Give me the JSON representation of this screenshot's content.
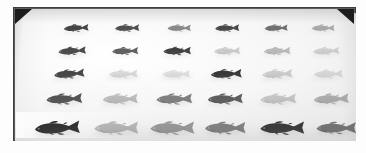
{
  "image": {
    "title": "Fish specimen photograph",
    "description": "Grayscale photograph of thirty fish specimens laid out in a five-row by six-column grid on a pale tray",
    "subject": "fish",
    "specimen_count": 30,
    "rows": 5,
    "columns": 6,
    "colors": {
      "board_frame": "#5d5d5d",
      "tray_surface": "#f2f2f2",
      "corner_mark": "#1c1c1c",
      "darkest_specimen": "#2b2b2b",
      "lightest_specimen": "#c9c9c9",
      "background": "#ffffff"
    },
    "geometry": {
      "board_left": 13,
      "board_top": 7,
      "board_width": 343,
      "board_height": 134,
      "top_corners_cut": true,
      "bottom_corners_square": true
    }
  },
  "specimens": [
    {
      "row": 1,
      "row_label": "row-1",
      "center_y": 20,
      "length": 34,
      "height": 9,
      "items": [
        {
          "col": 1,
          "name": "specimen-1-1",
          "cx": 62,
          "tone": "#3a3a3a",
          "opacity": 0.95,
          "flip": false,
          "tilt": -3,
          "scale": 1.0
        },
        {
          "col": 2,
          "name": "specimen-1-2",
          "cx": 113,
          "tone": "#3f3f3f",
          "opacity": 0.92,
          "flip": false,
          "tilt": -2,
          "scale": 0.98
        },
        {
          "col": 3,
          "name": "specimen-1-3",
          "cx": 165,
          "tone": "#6e6e6e",
          "opacity": 0.8,
          "flip": false,
          "tilt": -1,
          "scale": 0.94
        },
        {
          "col": 4,
          "name": "specimen-1-4",
          "cx": 213,
          "tone": "#383838",
          "opacity": 0.93,
          "flip": false,
          "tilt": -2,
          "scale": 0.97
        },
        {
          "col": 5,
          "name": "specimen-1-5",
          "cx": 262,
          "tone": "#575757",
          "opacity": 0.85,
          "flip": false,
          "tilt": -2,
          "scale": 0.93
        },
        {
          "col": 6,
          "name": "specimen-1-6",
          "cx": 309,
          "tone": "#8d8d8d",
          "opacity": 0.7,
          "flip": false,
          "tilt": -1,
          "scale": 0.92
        }
      ]
    },
    {
      "row": 2,
      "row_label": "row-2",
      "center_y": 43,
      "length": 38,
      "height": 10,
      "items": [
        {
          "col": 1,
          "name": "specimen-2-1",
          "cx": 58,
          "tone": "#3c3c3c",
          "opacity": 0.93,
          "flip": false,
          "tilt": -4,
          "scale": 1.0
        },
        {
          "col": 2,
          "name": "specimen-2-2",
          "cx": 111,
          "tone": "#4a4a4a",
          "opacity": 0.88,
          "flip": false,
          "tilt": -2,
          "scale": 0.95
        },
        {
          "col": 3,
          "name": "specimen-2-3",
          "cx": 163,
          "tone": "#353535",
          "opacity": 0.95,
          "flip": false,
          "tilt": -2,
          "scale": 1.0
        },
        {
          "col": 4,
          "name": "specimen-2-4",
          "cx": 213,
          "tone": "#b0b0b0",
          "opacity": 0.62,
          "flip": false,
          "tilt": -2,
          "scale": 0.94
        },
        {
          "col": 5,
          "name": "specimen-2-5",
          "cx": 263,
          "tone": "#9c9c9c",
          "opacity": 0.66,
          "flip": false,
          "tilt": -2,
          "scale": 0.97
        },
        {
          "col": 6,
          "name": "specimen-2-6",
          "cx": 312,
          "tone": "#b6b6b6",
          "opacity": 0.58,
          "flip": false,
          "tilt": -3,
          "scale": 0.95
        }
      ]
    },
    {
      "row": 3,
      "row_label": "row-3",
      "center_y": 66,
      "length": 42,
      "height": 11,
      "items": [
        {
          "col": 1,
          "name": "specimen-3-1",
          "cx": 55,
          "tone": "#3a3a3a",
          "opacity": 0.94,
          "flip": false,
          "tilt": -5,
          "scale": 1.0
        },
        {
          "col": 2,
          "name": "specimen-3-2",
          "cx": 109,
          "tone": "#bdbdbd",
          "opacity": 0.52,
          "flip": false,
          "tilt": -2,
          "scale": 0.95
        },
        {
          "col": 3,
          "name": "specimen-3-3",
          "cx": 162,
          "tone": "#c4c4c4",
          "opacity": 0.48,
          "flip": false,
          "tilt": -1,
          "scale": 0.92
        },
        {
          "col": 4,
          "name": "specimen-3-4",
          "cx": 212,
          "tone": "#2f2f2f",
          "opacity": 0.96,
          "flip": false,
          "tilt": -3,
          "scale": 1.02
        },
        {
          "col": 5,
          "name": "specimen-3-5",
          "cx": 263,
          "tone": "#aeaeae",
          "opacity": 0.58,
          "flip": false,
          "tilt": -3,
          "scale": 1.0
        },
        {
          "col": 6,
          "name": "specimen-3-6",
          "cx": 314,
          "tone": "#bdbdbd",
          "opacity": 0.52,
          "flip": false,
          "tilt": -2,
          "scale": 0.96
        }
      ]
    },
    {
      "row": 4,
      "row_label": "row-4",
      "center_y": 91,
      "length": 48,
      "height": 13,
      "items": [
        {
          "col": 1,
          "name": "specimen-4-1",
          "cx": 50,
          "tone": "#454545",
          "opacity": 0.92,
          "flip": false,
          "tilt": -3,
          "scale": 1.0
        },
        {
          "col": 2,
          "name": "specimen-4-2",
          "cx": 106,
          "tone": "#9e9e9e",
          "opacity": 0.66,
          "flip": false,
          "tilt": -2,
          "scale": 0.98
        },
        {
          "col": 3,
          "name": "specimen-4-3",
          "cx": 160,
          "tone": "#626262",
          "opacity": 0.8,
          "flip": false,
          "tilt": -2,
          "scale": 1.0
        },
        {
          "col": 4,
          "name": "specimen-4-4",
          "cx": 211,
          "tone": "#4c4c4c",
          "opacity": 0.9,
          "flip": false,
          "tilt": -2,
          "scale": 0.98
        },
        {
          "col": 5,
          "name": "specimen-4-5",
          "cx": 264,
          "tone": "#a8a8a8",
          "opacity": 0.62,
          "flip": false,
          "tilt": -2,
          "scale": 1.0
        },
        {
          "col": 6,
          "name": "specimen-4-6",
          "cx": 317,
          "tone": "#8f8f8f",
          "opacity": 0.7,
          "flip": false,
          "tilt": -3,
          "scale": 0.98
        }
      ]
    },
    {
      "row": 5,
      "row_label": "row-5",
      "center_y": 120,
      "length": 56,
      "height": 16,
      "items": [
        {
          "col": 1,
          "name": "specimen-5-1",
          "cx": 43,
          "tone": "#2b2b2b",
          "opacity": 0.97,
          "flip": false,
          "tilt": -3,
          "scale": 1.02
        },
        {
          "col": 2,
          "name": "specimen-5-2",
          "cx": 102,
          "tone": "#9a9a9a",
          "opacity": 0.7,
          "flip": false,
          "tilt": -1,
          "scale": 1.0
        },
        {
          "col": 3,
          "name": "specimen-5-3",
          "cx": 158,
          "tone": "#7d7d7d",
          "opacity": 0.78,
          "flip": false,
          "tilt": -1,
          "scale": 1.0
        },
        {
          "col": 4,
          "name": "specimen-5-4",
          "cx": 211,
          "tone": "#686868",
          "opacity": 0.82,
          "flip": false,
          "tilt": -1,
          "scale": 0.92
        },
        {
          "col": 5,
          "name": "specimen-5-5",
          "cx": 268,
          "tone": "#333333",
          "opacity": 0.96,
          "flip": false,
          "tilt": -1,
          "scale": 1.0
        },
        {
          "col": 6,
          "name": "specimen-5-6",
          "cx": 322,
          "tone": "#5e5e5e",
          "opacity": 0.85,
          "flip": false,
          "tilt": -1,
          "scale": 0.9
        }
      ]
    }
  ]
}
